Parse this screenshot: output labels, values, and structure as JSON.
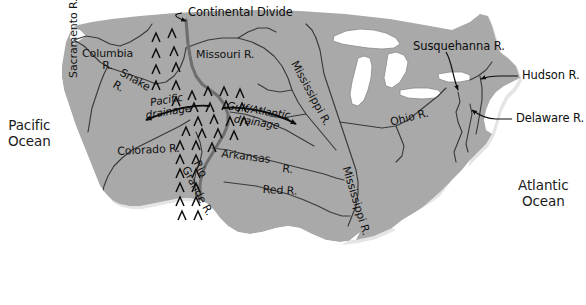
{
  "map": {
    "title": "Continental Divide and major river drainage map of the United States",
    "colors": {
      "land": "#a9a9a9",
      "land_shadow": "#8f8f8f",
      "water_fill": "#ffffff",
      "river_line": "#3a3a3a",
      "divide_line": "#6a6a6a",
      "background": "#ffffff",
      "text": "#111111"
    },
    "oceans": [
      {
        "name": "pacific-ocean",
        "lines": [
          "Pacific",
          "Ocean"
        ],
        "x": 8,
        "y": 118
      },
      {
        "name": "atlantic-ocean",
        "lines": [
          "Atlantic",
          "Ocean"
        ],
        "x": 518,
        "y": 178
      }
    ],
    "callouts": [
      {
        "name": "continental-divide",
        "label": "Continental Divide",
        "x": 185,
        "y": 11
      },
      {
        "name": "susquehanna-river",
        "label": "Susquehanna R.",
        "x": 414,
        "y": 44
      },
      {
        "name": "hudson-river",
        "label": "Hudson R.",
        "x": 521,
        "y": 71
      },
      {
        "name": "delaware-river",
        "label": "Delaware R.",
        "x": 516,
        "y": 114
      }
    ],
    "drainage_labels": [
      {
        "name": "pacific-drainage",
        "lines": [
          "Pacific",
          "drainage"
        ],
        "x": 144,
        "y": 104,
        "rotate": -9
      },
      {
        "name": "gulf-atlantic-drainage",
        "lines": [
          "Gulf/Atlantic",
          "drainage"
        ],
        "x": 232,
        "y": 107,
        "rotate": 8
      }
    ],
    "rivers": [
      {
        "name": "columbia-river",
        "lines": [
          "Columbia",
          "R."
        ],
        "x": 83,
        "y": 52,
        "rotate": 0,
        "align": "center"
      },
      {
        "name": "snake-river",
        "lines": [
          "Snake",
          "R."
        ],
        "x": 127,
        "y": 72,
        "rotate": 28,
        "align": "left"
      },
      {
        "name": "sacramento-river",
        "label": "Sacramento R.",
        "x": 73,
        "y": 78,
        "rotate": -90
      },
      {
        "name": "missouri-river",
        "label": "Missouri R.",
        "x": 196,
        "y": 54,
        "rotate": 0
      },
      {
        "name": "colorado-river",
        "label": "Colorado R.",
        "x": 118,
        "y": 150,
        "rotate": -3
      },
      {
        "name": "rio-grande-river",
        "lines": [
          "Rio",
          "Grande R."
        ],
        "x": 206,
        "y": 166,
        "rotate": 62
      },
      {
        "name": "arkansas-river",
        "label": "Arkansas",
        "x": 222,
        "y": 153,
        "rotate": 7
      },
      {
        "name": "arkansas-river-suffix",
        "label": "R.",
        "x": 283,
        "y": 168,
        "rotate": 6
      },
      {
        "name": "red-river",
        "label": "Red R.",
        "x": 264,
        "y": 188,
        "rotate": 3
      },
      {
        "name": "mississippi-river-upper",
        "label": "Mississippi R.",
        "x": 300,
        "y": 64,
        "rotate": 62
      },
      {
        "name": "mississippi-river-lower",
        "label": "Mississippi R.",
        "x": 352,
        "y": 170,
        "rotate": 73
      },
      {
        "name": "ohio-river",
        "label": "Ohio R.",
        "x": 390,
        "y": 121,
        "rotate": -13
      }
    ],
    "legend_note": "Chevron symbols mark the Continental Divide mountain range"
  }
}
